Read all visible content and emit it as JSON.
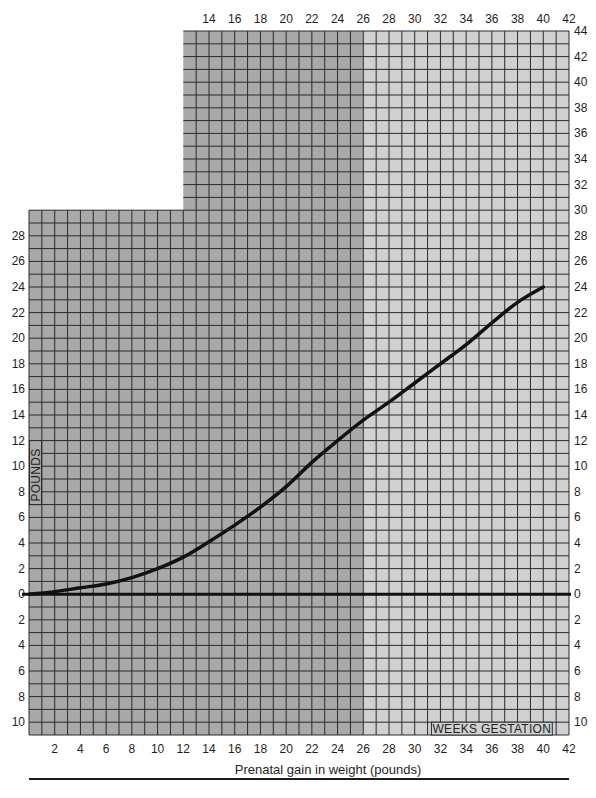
{
  "chart_data": {
    "type": "line",
    "title": "",
    "xlabel": "Prenatal gain in weight (pounds)",
    "ylabel": "POUNDS",
    "x_axis_secondary_label": "WEEKS GESTATION",
    "xlim": [
      0,
      42
    ],
    "ylim": [
      -11,
      44
    ],
    "x_ticks": [
      2,
      4,
      6,
      8,
      10,
      12,
      14,
      16,
      18,
      20,
      22,
      24,
      26,
      28,
      30,
      32,
      34,
      36,
      38,
      40,
      42
    ],
    "x_ticks_top": [
      14,
      16,
      18,
      20,
      22,
      24,
      26,
      28,
      30,
      32,
      34,
      36,
      38,
      40,
      42
    ],
    "y_ticks_left": [
      "28",
      "26",
      "24",
      "22",
      "20",
      "18",
      "16",
      "14",
      "12",
      "10",
      "8",
      "6",
      "4",
      "2",
      "0",
      "2",
      "4",
      "6",
      "8",
      "10"
    ],
    "y_ticks_right": [
      "44",
      "42",
      "40",
      "38",
      "36",
      "34",
      "32",
      "30",
      "28",
      "26",
      "24",
      "22",
      "20",
      "18",
      "16",
      "14",
      "12",
      "10",
      "8",
      "6",
      "4",
      "2",
      "0",
      "2",
      "4",
      "6",
      "8",
      "10"
    ],
    "grid": true,
    "shading": {
      "dark_region_weeks": [
        0,
        26
      ],
      "light_region_weeks": [
        26,
        42
      ],
      "dark_color": "#a9a9a9",
      "light_color": "#d0d0d0",
      "grid_color": "#2b2b2b"
    },
    "series": [
      {
        "name": "Prenatal weight gain",
        "color": "#111111",
        "x": [
          0,
          2,
          4,
          6,
          8,
          10,
          12,
          14,
          16,
          18,
          20,
          22,
          24,
          26,
          28,
          30,
          32,
          34,
          36,
          38,
          40
        ],
        "y": [
          0,
          0.2,
          0.5,
          0.8,
          1.3,
          2.0,
          2.9,
          4.1,
          5.4,
          6.8,
          8.4,
          10.3,
          12.0,
          13.6,
          15.0,
          16.5,
          18.0,
          19.5,
          21.2,
          22.8,
          24.0
        ]
      }
    ],
    "baseline": {
      "y": 0,
      "color": "#111111"
    }
  },
  "labels": {
    "xlabel": "Prenatal gain in weight (pounds)",
    "ylabel": "POUNDS",
    "weeks": "WEEKS GESTATION"
  }
}
